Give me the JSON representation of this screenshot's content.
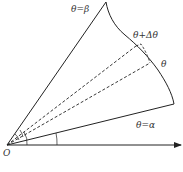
{
  "diagram": {
    "type": "polar-region-area-element",
    "labels": {
      "theta_beta": "θ=β",
      "theta_plus_dtheta": "θ+Δθ",
      "theta": "θ",
      "theta_alpha": "θ=α",
      "origin": "O"
    },
    "colors": {
      "stroke": "#222222",
      "text": "#333333",
      "background": "#ffffff"
    },
    "elements": [
      "polar axis arrow from O",
      "ray θ=α",
      "ray θ=β",
      "boundary curve r=r(θ) from θ=β to θ=α",
      "dashed ray at θ",
      "dashed ray at θ+Δθ",
      "dashed arc segment between rays",
      "angle arcs at O"
    ]
  }
}
